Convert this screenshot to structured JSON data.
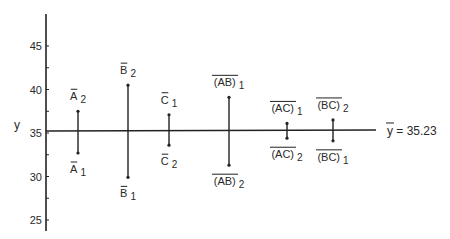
{
  "chart_data": {
    "type": "interval",
    "title": "",
    "xlabel": "",
    "ylabel": "y",
    "ylim": [
      25,
      48
    ],
    "yticks": [
      25,
      30,
      35,
      40,
      45
    ],
    "grid": false,
    "reference_line": {
      "label": "ȳ = 35.23",
      "label_main": "y",
      "label_rest": " = 35.23",
      "value": 35.23
    },
    "effects": [
      {
        "name": "A",
        "top_label": "A",
        "top_sub": "2",
        "top_value": 37.5,
        "bottom_label": "A",
        "bottom_sub": "1",
        "bottom_value": 32.7
      },
      {
        "name": "B",
        "top_label": "B",
        "top_sub": "2",
        "top_value": 40.5,
        "bottom_label": "B",
        "bottom_sub": "1",
        "bottom_value": 29.9
      },
      {
        "name": "C",
        "top_label": "C",
        "top_sub": "1",
        "top_value": 37.1,
        "bottom_label": "C",
        "bottom_sub": "2",
        "bottom_value": 33.6
      },
      {
        "name": "AB",
        "top_label": "(AB)",
        "top_sub": "1",
        "top_value": 39.1,
        "bottom_label": "(AB)",
        "bottom_sub": "2",
        "bottom_value": 31.3
      },
      {
        "name": "AC",
        "top_label": "(AC)",
        "top_sub": "1",
        "top_value": 36.1,
        "bottom_label": "(AC)",
        "bottom_sub": "2",
        "bottom_value": 34.4
      },
      {
        "name": "BC",
        "top_label": "(BC)",
        "top_sub": "2",
        "top_value": 36.5,
        "bottom_label": "(BC)",
        "bottom_sub": "1",
        "bottom_value": 34.1
      }
    ]
  }
}
